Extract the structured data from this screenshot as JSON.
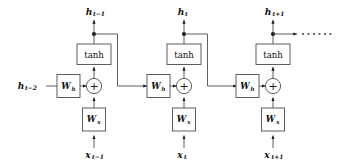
{
  "diagram": {
    "type": "rnn-unrolled-diagram",
    "colors": {
      "background": "#ffffff",
      "stroke": "#4d4d4d",
      "text": "#111111",
      "node_dot": "#1a1a1a"
    },
    "operator_symbol": "+",
    "activation_label": "tanh",
    "weight_hidden_label": "W",
    "weight_hidden_sub": "h",
    "weight_input_label": "W",
    "weight_input_sub": "x",
    "ellipsis_dots": 6,
    "input_state": {
      "base": "h",
      "sub": "t−2",
      "full": "h t−2"
    },
    "cells": [
      {
        "id": "cell-t-minus-1",
        "output_state_base": "h",
        "output_state_sub": "t−1",
        "input_base": "x",
        "input_sub": "t−1",
        "activation": "tanh",
        "operator": "+",
        "weight_h": "W",
        "weight_h_sub": "h",
        "weight_x": "W",
        "weight_x_sub": "x"
      },
      {
        "id": "cell-t",
        "output_state_base": "h",
        "output_state_sub": "t",
        "input_base": "x",
        "input_sub": "t",
        "activation": "tanh",
        "operator": "+",
        "weight_h": "W",
        "weight_h_sub": "h",
        "weight_x": "W",
        "weight_x_sub": "x"
      },
      {
        "id": "cell-t-plus-1",
        "output_state_base": "h",
        "output_state_sub": "t+1",
        "input_base": "x",
        "input_sub": "t+1",
        "activation": "tanh",
        "operator": "+",
        "weight_h": "W",
        "weight_h_sub": "h",
        "weight_x": "W",
        "weight_x_sub": "x"
      }
    ]
  }
}
